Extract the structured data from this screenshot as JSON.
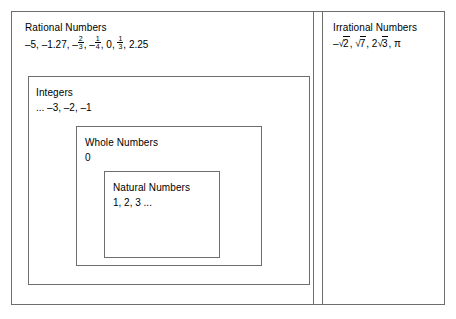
{
  "diagram": {
    "type": "nested-set-venn",
    "panels": [
      {
        "id": "rational",
        "title": "Rational Numbers",
        "members_text": "–5, –1.27, –⅔, –¼, 0, ⅓, 2.25",
        "members": [
          {
            "text": "–5",
            "kind": "integer"
          },
          {
            "text": "–1.27",
            "kind": "decimal"
          },
          {
            "text": "– 2/3",
            "kind": "fraction",
            "sign": "–",
            "numerator": "2",
            "denominator": "3"
          },
          {
            "text": "– 1/4",
            "kind": "fraction",
            "sign": "–",
            "numerator": "1",
            "denominator": "4"
          },
          {
            "text": "0",
            "kind": "integer"
          },
          {
            "text": "1/3",
            "kind": "fraction",
            "sign": "",
            "numerator": "1",
            "denominator": "3"
          },
          {
            "text": "2.25",
            "kind": "decimal"
          }
        ],
        "parts": {
          "lead": "–5, –1.27, ",
          "after_first_frac": ", ",
          "after_second_frac": ", 0, ",
          "after_third_frac": ", 2.25",
          "neg_sign": "–",
          "comma": ","
        }
      },
      {
        "id": "irrational",
        "title": "Irrational Numbers",
        "members_text": "–√2, √7, 2√3, π",
        "members": [
          {
            "text": "–√2",
            "kind": "radical",
            "coefficient": "–",
            "radicand": "2"
          },
          {
            "text": "√7",
            "kind": "radical",
            "coefficient": "",
            "radicand": "7"
          },
          {
            "text": "2√3",
            "kind": "radical",
            "coefficient": "2",
            "radicand": "3"
          },
          {
            "text": "π",
            "kind": "constant"
          }
        ],
        "parts": {
          "neg_sign": "–",
          "radical_sign": "√",
          "sep1": ", ",
          "sep2": ", ",
          "coef_2": "2",
          "sep3": ", ",
          "pi": "π",
          "radicand_1": "2",
          "radicand_2": "7",
          "radicand_3": "3"
        }
      }
    ],
    "nested_sets": [
      {
        "id": "integers",
        "title": "Integers",
        "members_text": "... –3, –2, –1"
      },
      {
        "id": "whole",
        "title": "Whole Numbers",
        "members_text": "0"
      },
      {
        "id": "natural",
        "title": "Natural Numbers",
        "members_text": "1, 2, 3 ..."
      }
    ],
    "colors": {
      "border": "#6e6e6e",
      "text": "#000000",
      "background": "#ffffff"
    }
  }
}
